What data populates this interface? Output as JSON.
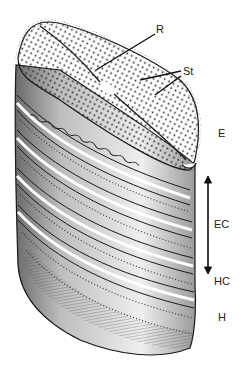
{
  "figure": {
    "labels": {
      "raphe": "R",
      "striae": "St",
      "epivalve": "E",
      "epicingulum": "EC",
      "hypocingulum": "HC",
      "hypovalve": "H"
    },
    "colors": {
      "ink": "#1a1a1a",
      "shade": "#8a8a8a",
      "background": "#ffffff"
    }
  }
}
